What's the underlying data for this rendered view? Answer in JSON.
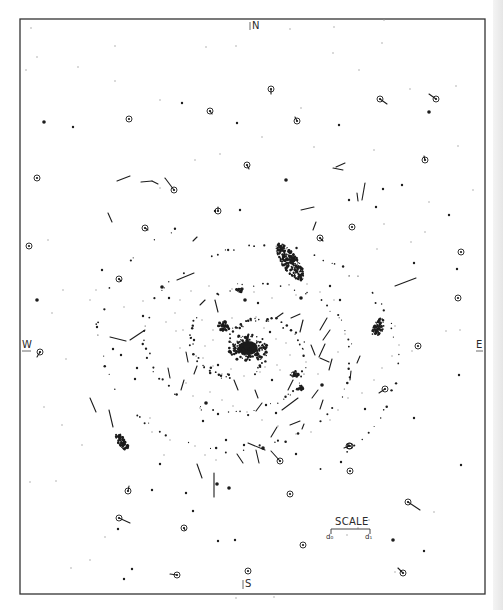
{
  "figure": {
    "type": "proper-motion chart of a spiral nebula",
    "frame": {
      "x": 20,
      "y": 19,
      "w": 465,
      "h": 575,
      "stroke": "#333333"
    },
    "ink_color": "#1c1c1c",
    "background": "#ffffff"
  },
  "compass": {
    "north": "N",
    "south": "S",
    "west": "W",
    "east": "E"
  },
  "scale": {
    "title": "SCALE",
    "left_label": "d₀",
    "right_label": "d₁"
  },
  "nucleus": {
    "cx": 248,
    "cy": 348,
    "rx": 14,
    "ry": 10
  },
  "condensations": [
    {
      "cx": 290,
      "cy": 262,
      "rx": 8,
      "ry": 22,
      "rot": -35
    },
    {
      "cx": 378,
      "cy": 328,
      "rx": 5,
      "ry": 10,
      "rot": 20
    },
    {
      "cx": 122,
      "cy": 442,
      "rx": 4,
      "ry": 10,
      "rot": -35
    },
    {
      "cx": 224,
      "cy": 326,
      "rx": 6,
      "ry": 5,
      "rot": 0
    },
    {
      "cx": 294,
      "cy": 374,
      "rx": 5,
      "ry": 3,
      "rot": 0
    },
    {
      "cx": 240,
      "cy": 290,
      "rx": 4,
      "ry": 2,
      "rot": 0
    },
    {
      "cx": 300,
      "cy": 388,
      "rx": 3,
      "ry": 3,
      "rot": 0
    }
  ],
  "circled_stars": [
    {
      "x": 271,
      "y": 89,
      "vx": 0,
      "vy": 5
    },
    {
      "x": 380,
      "y": 99,
      "vx": 7,
      "vy": 5
    },
    {
      "x": 436,
      "y": 99,
      "vx": -7,
      "vy": -5
    },
    {
      "x": 210,
      "y": 111,
      "vx": 2,
      "vy": 3
    },
    {
      "x": 297,
      "y": 121,
      "vx": -2,
      "vy": -4
    },
    {
      "x": 129,
      "y": 119,
      "vx": 0,
      "vy": 0
    },
    {
      "x": 37,
      "y": 178,
      "vx": 0,
      "vy": 0
    },
    {
      "x": 174,
      "y": 190,
      "vx": -9,
      "vy": -12
    },
    {
      "x": 247,
      "y": 165,
      "vx": 2,
      "vy": 4
    },
    {
      "x": 425,
      "y": 160,
      "vx": -1,
      "vy": -4
    },
    {
      "x": 218,
      "y": 211,
      "vx": 0,
      "vy": -4
    },
    {
      "x": 145,
      "y": 228,
      "vx": 3,
      "vy": 2
    },
    {
      "x": 320,
      "y": 238,
      "vx": 3,
      "vy": 3
    },
    {
      "x": 352,
      "y": 227,
      "vx": 0,
      "vy": 0
    },
    {
      "x": 29,
      "y": 246,
      "vx": 0,
      "vy": 0
    },
    {
      "x": 461,
      "y": 252,
      "vx": 0,
      "vy": 0
    },
    {
      "x": 119,
      "y": 279,
      "vx": 2,
      "vy": 2
    },
    {
      "x": 40,
      "y": 352,
      "vx": -3,
      "vy": 5
    },
    {
      "x": 418,
      "y": 346,
      "vx": 0,
      "vy": 0
    },
    {
      "x": 349,
      "y": 446,
      "vx": -5,
      "vy": 2
    },
    {
      "x": 385,
      "y": 389,
      "vx": -6,
      "vy": 4
    },
    {
      "x": 280,
      "y": 461,
      "vx": -9,
      "vy": -10
    },
    {
      "x": 350,
      "y": 446,
      "vx": 0,
      "vy": 0
    },
    {
      "x": 128,
      "y": 491,
      "vx": 1,
      "vy": -5
    },
    {
      "x": 290,
      "y": 494,
      "vx": 0,
      "vy": 0
    },
    {
      "x": 408,
      "y": 502,
      "vx": 12,
      "vy": 8
    },
    {
      "x": 184,
      "y": 528,
      "vx": 1,
      "vy": 2
    },
    {
      "x": 119,
      "y": 518,
      "vx": 11,
      "vy": 5
    },
    {
      "x": 303,
      "y": 545,
      "vx": 0,
      "vy": 0
    },
    {
      "x": 177,
      "y": 575,
      "vx": -7,
      "vy": -1
    },
    {
      "x": 248,
      "y": 571,
      "vx": 0,
      "vy": 0
    },
    {
      "x": 403,
      "y": 573,
      "vx": -5,
      "vy": -5
    },
    {
      "x": 458,
      "y": 298,
      "vx": 0,
      "vy": 0
    },
    {
      "x": 350,
      "y": 471,
      "vx": 0,
      "vy": 0
    }
  ],
  "vectors": [
    {
      "x1": 117,
      "y1": 181,
      "x2": 130,
      "y2": 176
    },
    {
      "x1": 141,
      "y1": 182,
      "x2": 152,
      "y2": 181
    },
    {
      "x1": 152,
      "y1": 181,
      "x2": 158,
      "y2": 184
    },
    {
      "x1": 177,
      "y1": 280,
      "x2": 194,
      "y2": 273
    },
    {
      "x1": 336,
      "y1": 167,
      "x2": 345,
      "y2": 163
    },
    {
      "x1": 333,
      "y1": 168,
      "x2": 343,
      "y2": 170
    },
    {
      "x1": 365,
      "y1": 183,
      "x2": 362,
      "y2": 200
    },
    {
      "x1": 357,
      "y1": 193,
      "x2": 358,
      "y2": 201
    },
    {
      "x1": 301,
      "y1": 210,
      "x2": 314,
      "y2": 207
    },
    {
      "x1": 316,
      "y1": 222,
      "x2": 313,
      "y2": 230
    },
    {
      "x1": 110,
      "y1": 337,
      "x2": 126,
      "y2": 341
    },
    {
      "x1": 130,
      "y1": 340,
      "x2": 145,
      "y2": 330
    },
    {
      "x1": 90,
      "y1": 398,
      "x2": 96,
      "y2": 412
    },
    {
      "x1": 109,
      "y1": 410,
      "x2": 113,
      "y2": 427
    },
    {
      "x1": 395,
      "y1": 286,
      "x2": 416,
      "y2": 278
    },
    {
      "x1": 282,
      "y1": 410,
      "x2": 298,
      "y2": 398
    },
    {
      "x1": 256,
      "y1": 411,
      "x2": 262,
      "y2": 403
    },
    {
      "x1": 271,
      "y1": 437,
      "x2": 277,
      "y2": 427
    },
    {
      "x1": 290,
      "y1": 425,
      "x2": 300,
      "y2": 421
    },
    {
      "x1": 304,
      "y1": 424,
      "x2": 302,
      "y2": 429
    },
    {
      "x1": 248,
      "y1": 443,
      "x2": 265,
      "y2": 450
    },
    {
      "x1": 256,
      "y1": 450,
      "x2": 259,
      "y2": 463
    },
    {
      "x1": 237,
      "y1": 454,
      "x2": 243,
      "y2": 463
    },
    {
      "x1": 197,
      "y1": 464,
      "x2": 202,
      "y2": 478
    },
    {
      "x1": 214,
      "y1": 473,
      "x2": 214,
      "y2": 497
    },
    {
      "x1": 181,
      "y1": 390,
      "x2": 184,
      "y2": 380
    },
    {
      "x1": 168,
      "y1": 368,
      "x2": 170,
      "y2": 378
    },
    {
      "x1": 186,
      "y1": 352,
      "x2": 188,
      "y2": 362
    },
    {
      "x1": 197,
      "y1": 366,
      "x2": 194,
      "y2": 374
    },
    {
      "x1": 300,
      "y1": 332,
      "x2": 303,
      "y2": 320
    },
    {
      "x1": 320,
      "y1": 330,
      "x2": 327,
      "y2": 318
    },
    {
      "x1": 323,
      "y1": 340,
      "x2": 330,
      "y2": 330
    },
    {
      "x1": 311,
      "y1": 345,
      "x2": 315,
      "y2": 355
    },
    {
      "x1": 319,
      "y1": 357,
      "x2": 325,
      "y2": 344
    },
    {
      "x1": 320,
      "y1": 358,
      "x2": 329,
      "y2": 362
    },
    {
      "x1": 332,
      "y1": 359,
      "x2": 329,
      "y2": 370
    },
    {
      "x1": 357,
      "y1": 363,
      "x2": 360,
      "y2": 356
    },
    {
      "x1": 350,
      "y1": 380,
      "x2": 351,
      "y2": 371
    },
    {
      "x1": 312,
      "y1": 398,
      "x2": 318,
      "y2": 390
    },
    {
      "x1": 320,
      "y1": 409,
      "x2": 323,
      "y2": 400
    },
    {
      "x1": 234,
      "y1": 380,
      "x2": 238,
      "y2": 390
    },
    {
      "x1": 255,
      "y1": 390,
      "x2": 258,
      "y2": 398
    },
    {
      "x1": 276,
      "y1": 318,
      "x2": 283,
      "y2": 313
    },
    {
      "x1": 291,
      "y1": 318,
      "x2": 300,
      "y2": 314
    },
    {
      "x1": 215,
      "y1": 300,
      "x2": 218,
      "y2": 312
    },
    {
      "x1": 200,
      "y1": 305,
      "x2": 205,
      "y2": 300
    },
    {
      "x1": 108,
      "y1": 213,
      "x2": 112,
      "y2": 222
    },
    {
      "x1": 193,
      "y1": 241,
      "x2": 197,
      "y2": 237
    },
    {
      "x1": 288,
      "y1": 390,
      "x2": 293,
      "y2": 380
    }
  ],
  "dots": [
    [
      44,
      122
    ],
    [
      73,
      127
    ],
    [
      182,
      103
    ],
    [
      237,
      123
    ],
    [
      339,
      125
    ],
    [
      429,
      112
    ],
    [
      383,
      189
    ],
    [
      402,
      185
    ],
    [
      215,
      211
    ],
    [
      240,
      210
    ],
    [
      286,
      180
    ],
    [
      349,
      200
    ],
    [
      376,
      207
    ],
    [
      449,
      215
    ],
    [
      414,
      263
    ],
    [
      37,
      300
    ],
    [
      457,
      269
    ],
    [
      459,
      375
    ],
    [
      218,
      365
    ],
    [
      461,
      465
    ],
    [
      263,
      448
    ],
    [
      296,
      454
    ],
    [
      341,
      462
    ],
    [
      414,
      418
    ],
    [
      160,
      464
    ],
    [
      217,
      484
    ],
    [
      118,
      529
    ],
    [
      132,
      569
    ],
    [
      124,
      579
    ],
    [
      424,
      551
    ],
    [
      393,
      540
    ],
    [
      218,
      541
    ],
    [
      235,
      540
    ],
    [
      152,
      490
    ],
    [
      193,
      511
    ],
    [
      229,
      488
    ],
    [
      186,
      493
    ],
    [
      102,
      270
    ],
    [
      143,
      316
    ],
    [
      169,
      298
    ],
    [
      162,
      287
    ],
    [
      97,
      327
    ],
    [
      137,
      368
    ],
    [
      135,
      379
    ],
    [
      266,
      405
    ],
    [
      322,
      385
    ],
    [
      365,
      409
    ],
    [
      244,
      445
    ],
    [
      276,
      413
    ],
    [
      218,
      414
    ],
    [
      206,
      403
    ],
    [
      203,
      421
    ],
    [
      226,
      440
    ],
    [
      113,
      349
    ],
    [
      121,
      355
    ],
    [
      245,
      300
    ],
    [
      258,
      303
    ],
    [
      270,
      332
    ],
    [
      272,
      380
    ],
    [
      194,
      340
    ],
    [
      301,
      298
    ],
    [
      330,
      286
    ],
    [
      340,
      300
    ]
  ],
  "faint_dots": [
    [
      31,
      28
    ],
    [
      115,
      46
    ],
    [
      206,
      47
    ],
    [
      236,
      46
    ],
    [
      290,
      29
    ],
    [
      334,
      27
    ],
    [
      384,
      20
    ],
    [
      333,
      53
    ],
    [
      382,
      43
    ],
    [
      359,
      70
    ],
    [
      37,
      57
    ],
    [
      26,
      70
    ],
    [
      115,
      81
    ],
    [
      78,
      67
    ],
    [
      160,
      100
    ],
    [
      301,
      108
    ],
    [
      410,
      89
    ],
    [
      456,
      86
    ],
    [
      458,
      146
    ],
    [
      429,
      202
    ],
    [
      473,
      190
    ],
    [
      395,
      326
    ],
    [
      399,
      345
    ],
    [
      412,
      351
    ],
    [
      446,
      331
    ],
    [
      460,
      330
    ],
    [
      369,
      520
    ],
    [
      358,
      528
    ],
    [
      434,
      512
    ],
    [
      347,
      535
    ],
    [
      395,
      572
    ],
    [
      274,
      597
    ],
    [
      236,
      598
    ],
    [
      90,
      560
    ],
    [
      71,
      568
    ],
    [
      105,
      537
    ],
    [
      56,
      481
    ],
    [
      30,
      482
    ],
    [
      44,
      407
    ],
    [
      62,
      425
    ],
    [
      82,
      445
    ],
    [
      66,
      359
    ],
    [
      52,
      313
    ],
    [
      63,
      290
    ],
    [
      48,
      240
    ],
    [
      160,
      188
    ],
    [
      195,
      160
    ],
    [
      220,
      154
    ],
    [
      262,
      137
    ],
    [
      314,
      147
    ],
    [
      374,
      150
    ],
    [
      384,
      224
    ],
    [
      411,
      242
    ],
    [
      377,
      249
    ],
    [
      425,
      232
    ],
    [
      150,
      418
    ],
    [
      152,
      432
    ],
    [
      170,
      440
    ],
    [
      195,
      446
    ],
    [
      164,
      455
    ],
    [
      205,
      455
    ],
    [
      216,
      460
    ],
    [
      96,
      290
    ],
    [
      90,
      300
    ],
    [
      124,
      307
    ],
    [
      143,
      301
    ],
    [
      166,
      322
    ],
    [
      183,
      330
    ],
    [
      202,
      320
    ],
    [
      213,
      330
    ],
    [
      232,
      318
    ],
    [
      256,
      317
    ],
    [
      264,
      328
    ],
    [
      276,
      339
    ],
    [
      286,
      343
    ],
    [
      290,
      355
    ],
    [
      277,
      365
    ],
    [
      265,
      367
    ],
    [
      231,
      369
    ],
    [
      213,
      366
    ],
    [
      203,
      358
    ],
    [
      205,
      346
    ],
    [
      213,
      340
    ],
    [
      222,
      374
    ],
    [
      244,
      376
    ],
    [
      260,
      372
    ],
    [
      280,
      370
    ],
    [
      306,
      362
    ],
    [
      318,
      374
    ],
    [
      338,
      352
    ],
    [
      345,
      334
    ],
    [
      334,
      300
    ],
    [
      320,
      292
    ],
    [
      307,
      284
    ],
    [
      296,
      295
    ],
    [
      272,
      298
    ],
    [
      254,
      292
    ],
    [
      232,
      289
    ],
    [
      209,
      286
    ],
    [
      191,
      291
    ],
    [
      180,
      300
    ],
    [
      175,
      313
    ],
    [
      176,
      331
    ],
    [
      180,
      348
    ],
    [
      186,
      383
    ],
    [
      193,
      396
    ],
    [
      200,
      408
    ],
    [
      210,
      392
    ],
    [
      222,
      400
    ],
    [
      233,
      406
    ],
    [
      247,
      412
    ],
    [
      262,
      420
    ],
    [
      278,
      426
    ],
    [
      296,
      434
    ],
    [
      311,
      432
    ],
    [
      330,
      420
    ],
    [
      338,
      410
    ],
    [
      348,
      398
    ],
    [
      362,
      393
    ],
    [
      374,
      380
    ],
    [
      382,
      368
    ],
    [
      392,
      356
    ]
  ]
}
